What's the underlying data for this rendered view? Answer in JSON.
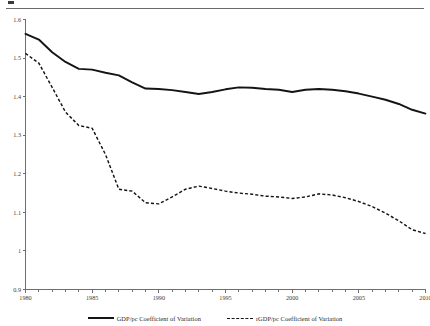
{
  "chart_data": {
    "type": "line",
    "title": "",
    "xlabel": "",
    "ylabel": "",
    "xlim": [
      1980,
      2010
    ],
    "ylim": [
      0.9,
      1.6
    ],
    "grid": false,
    "legend_position": "bottom-center",
    "x": [
      1980,
      1981,
      1982,
      1983,
      1984,
      1985,
      1986,
      1987,
      1988,
      1989,
      1990,
      1991,
      1992,
      1993,
      1994,
      1995,
      1996,
      1997,
      1998,
      1999,
      2000,
      2001,
      2002,
      2003,
      2004,
      2005,
      2006,
      2007,
      2008,
      2009,
      2010
    ],
    "xticks": [
      1980,
      1985,
      1990,
      1995,
      2000,
      2005,
      2010
    ],
    "xtick_labels": [
      "1980",
      "1985",
      "1990",
      "1995",
      "2000",
      "2005",
      "2010"
    ],
    "xminor_step": 1,
    "yticks": [
      0.9,
      1.0,
      1.1,
      1.2,
      1.3,
      1.4,
      1.5,
      1.6
    ],
    "ytick_labels": [
      "0.9",
      "1",
      "1.1",
      "1.2",
      "1.3",
      "1.4",
      "1.5",
      "1.6"
    ],
    "series": [
      {
        "name": "GDP/pc Coefficient of Variation",
        "style": "solid",
        "color": "#141414",
        "values": [
          1.563,
          1.548,
          1.515,
          1.49,
          1.472,
          1.47,
          1.462,
          1.455,
          1.437,
          1.421,
          1.42,
          1.417,
          1.412,
          1.407,
          1.412,
          1.419,
          1.424,
          1.423,
          1.42,
          1.418,
          1.412,
          1.418,
          1.42,
          1.418,
          1.414,
          1.408,
          1.4,
          1.392,
          1.381,
          1.366,
          1.356
        ]
      },
      {
        "name": "rGDP/pc Coefficient of Variation",
        "style": "dashed",
        "color": "#141414",
        "values": [
          1.512,
          1.487,
          1.424,
          1.36,
          1.325,
          1.318,
          1.25,
          1.16,
          1.155,
          1.125,
          1.122,
          1.14,
          1.16,
          1.168,
          1.162,
          1.155,
          1.15,
          1.147,
          1.142,
          1.14,
          1.136,
          1.14,
          1.148,
          1.145,
          1.138,
          1.128,
          1.115,
          1.098,
          1.078,
          1.055,
          1.045
        ]
      }
    ]
  },
  "legend": {
    "entries": [
      {
        "label": "GDP/pc Coefficient of Variation",
        "style": "solid"
      },
      {
        "label": "rGDP/pc Coefficient of Variation",
        "style": "dashed"
      }
    ]
  }
}
